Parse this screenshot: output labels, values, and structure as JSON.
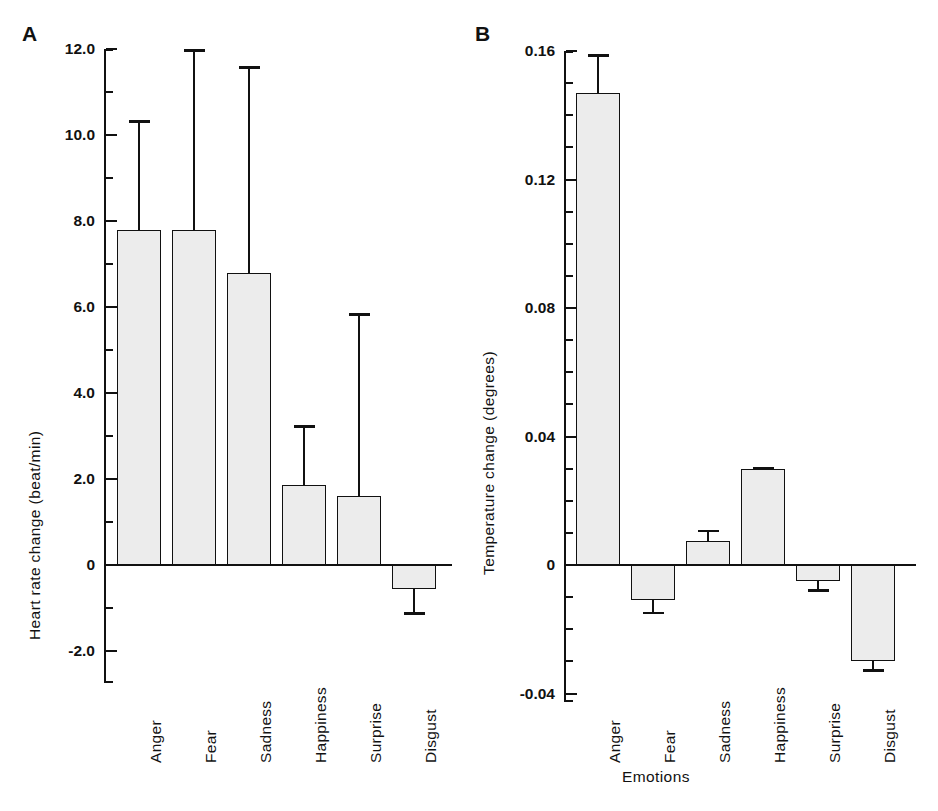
{
  "figure": {
    "xlabel": "Emotions",
    "panels": [
      {
        "letter": "A",
        "ylabel": "Heart rate change (beat/min)",
        "ticks": [
          "12.0",
          "10.0",
          "8.0",
          "6.0",
          "4.0",
          "2.0",
          "0",
          "-2.0"
        ],
        "categories": [
          "Anger",
          "Fear",
          "Sadness",
          "Happiness",
          "Surprise",
          "Disgust"
        ]
      },
      {
        "letter": "B",
        "ylabel": "Temperature change (degrees)",
        "ticks": [
          "0.16",
          "0.12",
          "0.08",
          "0.04",
          "0",
          "-0.04"
        ],
        "categories": [
          "Anger",
          "Fear",
          "Sadness",
          "Happiness",
          "Surprise",
          "Disgust"
        ]
      }
    ]
  },
  "chart_data": [
    {
      "type": "bar",
      "panel": "A",
      "title": "",
      "xlabel": "Emotions",
      "ylabel": "Heart rate change (beat/min)",
      "categories": [
        "Anger",
        "Fear",
        "Sadness",
        "Happiness",
        "Surprise",
        "Disgust"
      ],
      "values": [
        7.8,
        7.8,
        6.8,
        1.85,
        1.6,
        -0.55
      ],
      "errors_upper": [
        10.35,
        12.0,
        11.6,
        3.25,
        5.85,
        null
      ],
      "errors_lower": [
        null,
        null,
        null,
        null,
        null,
        -1.1
      ],
      "ylim": [
        -2.6,
        12.6
      ],
      "ytick_values": [
        12.0,
        10.0,
        8.0,
        6.0,
        4.0,
        2.0,
        0,
        -2.0
      ],
      "ytick_labels": [
        "12.0",
        "10.0",
        "8.0",
        "6.0",
        "4.0",
        "2.0",
        "0",
        "-2.0"
      ],
      "minor_tick_step": 1.0,
      "grid": false,
      "legend": "none",
      "error_type": "standard deviation"
    },
    {
      "type": "bar",
      "panel": "B",
      "title": "",
      "xlabel": "Emotions",
      "ylabel": "Temperature change (degrees)",
      "categories": [
        "Anger",
        "Fear",
        "Sadness",
        "Happiness",
        "Surprise",
        "Disgust"
      ],
      "values": [
        0.147,
        -0.011,
        0.0075,
        0.03,
        -0.005,
        -0.03
      ],
      "errors_upper": [
        0.159,
        null,
        0.011,
        0.0305,
        null,
        null
      ],
      "errors_lower": [
        null,
        -0.0145,
        null,
        null,
        -0.0075,
        -0.0325
      ],
      "ylim": [
        -0.045,
        0.165
      ],
      "ytick_values": [
        0.16,
        0.12,
        0.08,
        0.04,
        0,
        -0.04
      ],
      "ytick_labels": [
        "0.16",
        "0.12",
        "0.08",
        "0.04",
        "0",
        "-0.04"
      ],
      "minor_tick_step": 0.01,
      "grid": false,
      "legend": "none",
      "error_type": "standard deviation"
    }
  ]
}
